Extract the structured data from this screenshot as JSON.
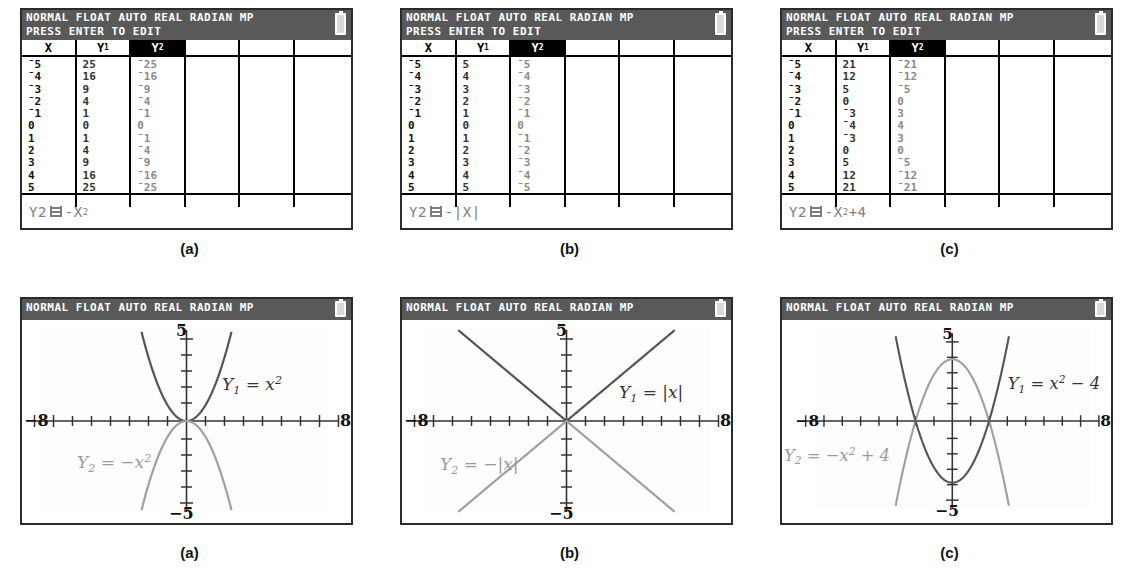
{
  "figure": {
    "panels": [
      {
        "id": "a",
        "caption": "(a)",
        "table": {
          "status_line_1": "NORMAL FLOAT AUTO REAL RADIAN MP",
          "status_line_2": "PRESS ENTER TO EDIT",
          "headers": [
            "X",
            "Y1",
            "Y2",
            "",
            "",
            ""
          ],
          "selected_header_index": 2,
          "rows": [
            [
              "-5",
              "25",
              "-25"
            ],
            [
              "-4",
              "16",
              "-16"
            ],
            [
              "-3",
              "9",
              "-9"
            ],
            [
              "-2",
              "4",
              "-4"
            ],
            [
              "-1",
              "1",
              "-1"
            ],
            [
              "0",
              "0",
              "0"
            ],
            [
              "1",
              "1",
              "-1"
            ],
            [
              "2",
              "4",
              "-4"
            ],
            [
              "3",
              "9",
              "-9"
            ],
            [
              "4",
              "16",
              "-16"
            ],
            [
              "5",
              "25",
              "-25"
            ]
          ],
          "formula_var": "Y2",
          "formula_body": "-X",
          "formula_exponent": "2",
          "formula_tail": ""
        },
        "graph": {
          "status_line_1": "NORMAL FLOAT AUTO REAL RADIAN MP",
          "x_left_label": "-8",
          "x_right_label": "8",
          "y_top_label": "5",
          "y_bottom_label": "-5",
          "label_y1": "Y1 = x2",
          "label_y2": "Y2 = -x2"
        }
      },
      {
        "id": "b",
        "caption": "(b)",
        "table": {
          "status_line_1": "NORMAL FLOAT AUTO REAL RADIAN MP",
          "status_line_2": "PRESS ENTER TO EDIT",
          "headers": [
            "X",
            "Y1",
            "Y2",
            "",
            "",
            ""
          ],
          "selected_header_index": 2,
          "rows": [
            [
              "-5",
              "5",
              "-5"
            ],
            [
              "-4",
              "4",
              "-4"
            ],
            [
              "-3",
              "3",
              "-3"
            ],
            [
              "-2",
              "2",
              "-2"
            ],
            [
              "-1",
              "1",
              "-1"
            ],
            [
              "0",
              "0",
              "0"
            ],
            [
              "1",
              "1",
              "-1"
            ],
            [
              "2",
              "2",
              "-2"
            ],
            [
              "3",
              "3",
              "-3"
            ],
            [
              "4",
              "4",
              "-4"
            ],
            [
              "5",
              "5",
              "-5"
            ]
          ],
          "formula_var": "Y2",
          "formula_body": "-|X|",
          "formula_exponent": "",
          "formula_tail": ""
        },
        "graph": {
          "status_line_1": "NORMAL FLOAT AUTO REAL RADIAN MP",
          "x_left_label": "-8",
          "x_right_label": "8",
          "y_top_label": "5",
          "y_bottom_label": "-5",
          "label_y1": "Y1 = |x|",
          "label_y2": "Y2 = -|x|"
        }
      },
      {
        "id": "c",
        "caption": "(c)",
        "table": {
          "status_line_1": "NORMAL FLOAT AUTO REAL RADIAN MP",
          "status_line_2": "PRESS ENTER TO EDIT",
          "headers": [
            "X",
            "Y1",
            "Y2",
            "",
            "",
            ""
          ],
          "selected_header_index": 2,
          "rows": [
            [
              "-5",
              "21",
              "-21"
            ],
            [
              "-4",
              "12",
              "-12"
            ],
            [
              "-3",
              "5",
              "-5"
            ],
            [
              "-2",
              "0",
              "0"
            ],
            [
              "-1",
              "-3",
              "3"
            ],
            [
              "0",
              "-4",
              "4"
            ],
            [
              "1",
              "-3",
              "3"
            ],
            [
              "2",
              "0",
              "0"
            ],
            [
              "3",
              "5",
              "-5"
            ],
            [
              "4",
              "12",
              "-12"
            ],
            [
              "5",
              "21",
              "-21"
            ]
          ],
          "formula_var": "Y2",
          "formula_body": "-X",
          "formula_exponent": "2",
          "formula_tail": "+4"
        },
        "graph": {
          "status_line_1": "NORMAL FLOAT AUTO REAL RADIAN MP",
          "x_left_label": "-8",
          "x_right_label": "8",
          "y_top_label": "5",
          "y_bottom_label": "-5",
          "label_y1": "Y1 = x2 - 4",
          "label_y2": "Y2 = -x2 + 4"
        }
      }
    ]
  },
  "chart_data": [
    {
      "type": "line",
      "panel": "a",
      "title": "",
      "xlabel": "x",
      "ylabel": "y",
      "xlim": [
        -8,
        8
      ],
      "ylim": [
        -5,
        5
      ],
      "grid": false,
      "ticks_x": [
        -7,
        -6,
        -5,
        -4,
        -3,
        -2,
        -1,
        0,
        1,
        2,
        3,
        4,
        5,
        6,
        7
      ],
      "ticks_y": [
        -4,
        -3,
        -2,
        -1,
        0,
        1,
        2,
        3,
        4
      ],
      "series": [
        {
          "name": "Y1 = x^2",
          "color": "#555555",
          "expression": "x^2",
          "x": [
            -5,
            -4,
            -3,
            -2,
            -1,
            0,
            1,
            2,
            3,
            4,
            5
          ],
          "values": [
            25,
            16,
            9,
            4,
            1,
            0,
            1,
            4,
            9,
            16,
            25
          ]
        },
        {
          "name": "Y2 = -x^2",
          "color": "#a0a0a0",
          "expression": "-x^2",
          "x": [
            -5,
            -4,
            -3,
            -2,
            -1,
            0,
            1,
            2,
            3,
            4,
            5
          ],
          "values": [
            -25,
            -16,
            -9,
            -4,
            -1,
            0,
            -1,
            -4,
            -9,
            -16,
            -25
          ]
        }
      ]
    },
    {
      "type": "line",
      "panel": "b",
      "title": "",
      "xlabel": "x",
      "ylabel": "y",
      "xlim": [
        -8,
        8
      ],
      "ylim": [
        -5,
        5
      ],
      "grid": false,
      "ticks_x": [
        -7,
        -6,
        -5,
        -4,
        -3,
        -2,
        -1,
        0,
        1,
        2,
        3,
        4,
        5,
        6,
        7
      ],
      "ticks_y": [
        -4,
        -3,
        -2,
        -1,
        0,
        1,
        2,
        3,
        4
      ],
      "series": [
        {
          "name": "Y1 = |x|",
          "color": "#555555",
          "expression": "abs(x)",
          "x": [
            -5,
            -4,
            -3,
            -2,
            -1,
            0,
            1,
            2,
            3,
            4,
            5
          ],
          "values": [
            5,
            4,
            3,
            2,
            1,
            0,
            1,
            2,
            3,
            4,
            5
          ]
        },
        {
          "name": "Y2 = -|x|",
          "color": "#a0a0a0",
          "expression": "-abs(x)",
          "x": [
            -5,
            -4,
            -3,
            -2,
            -1,
            0,
            1,
            2,
            3,
            4,
            5
          ],
          "values": [
            -5,
            -4,
            -3,
            -2,
            -1,
            0,
            -1,
            -2,
            -3,
            -4,
            -5
          ]
        }
      ]
    },
    {
      "type": "line",
      "panel": "c",
      "title": "",
      "xlabel": "x",
      "ylabel": "y",
      "xlim": [
        -8,
        8
      ],
      "ylim": [
        -5,
        5
      ],
      "grid": false,
      "ticks_x": [
        -7,
        -6,
        -5,
        -4,
        -3,
        -2,
        -1,
        0,
        1,
        2,
        3,
        4,
        5,
        6,
        7
      ],
      "ticks_y": [
        -4,
        -3,
        -2,
        -1,
        0,
        1,
        2,
        3,
        4
      ],
      "series": [
        {
          "name": "Y1 = x^2 - 4",
          "color": "#555555",
          "expression": "x^2-4",
          "x": [
            -5,
            -4,
            -3,
            -2,
            -1,
            0,
            1,
            2,
            3,
            4,
            5
          ],
          "values": [
            21,
            12,
            5,
            0,
            -3,
            -4,
            -3,
            0,
            5,
            12,
            21
          ]
        },
        {
          "name": "Y2 = -x^2 + 4",
          "color": "#a0a0a0",
          "expression": "-x^2+4",
          "x": [
            -5,
            -4,
            -3,
            -2,
            -1,
            0,
            1,
            2,
            3,
            4,
            5
          ],
          "values": [
            -21,
            -12,
            -5,
            0,
            3,
            4,
            3,
            0,
            -5,
            -12,
            -21
          ]
        }
      ]
    }
  ]
}
